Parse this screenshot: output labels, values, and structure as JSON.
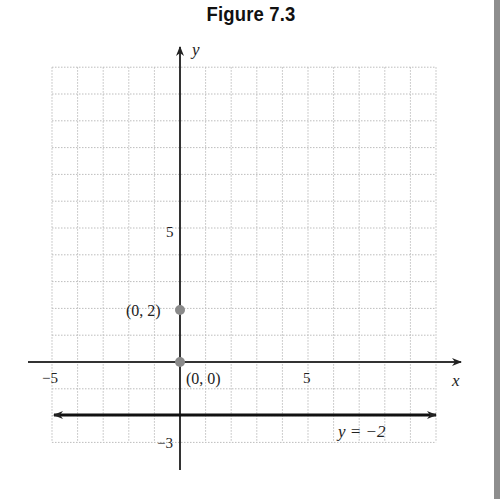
{
  "figure": {
    "title": "Figure 7.3"
  },
  "chart_data": {
    "type": "line",
    "title": "Figure 7.3",
    "xlabel": "x",
    "ylabel": "y",
    "xlim": [
      -5,
      10
    ],
    "ylim": [
      -3,
      11
    ],
    "grid": true,
    "x_ticks": [
      {
        "value": -5,
        "label": "−5"
      },
      {
        "value": 5,
        "label": "5"
      }
    ],
    "y_ticks": [
      {
        "value": 5,
        "label": "5"
      },
      {
        "value": -3,
        "label": "−3"
      }
    ],
    "series": [
      {
        "name": "y = −2",
        "type": "line",
        "x": [
          -5,
          10
        ],
        "y": [
          -2,
          -2
        ],
        "arrows": "both"
      }
    ],
    "points": [
      {
        "x": 0,
        "y": 2,
        "label": "(0, 2)"
      },
      {
        "x": 0,
        "y": 0,
        "label": "(0, 0)"
      }
    ],
    "annotations": [
      {
        "text": "y = −2",
        "x": 7,
        "y": -2.5
      }
    ]
  },
  "labels": {
    "x_axis": "x",
    "y_axis": "y",
    "tick_x_neg5": "−5",
    "tick_x_5": "5",
    "tick_y_5": "5",
    "tick_y_neg3": "−3",
    "point_a": "(0, 2)",
    "point_b": "(0, 0)",
    "line_label": "y = −2"
  },
  "colors": {
    "axis": "#222222",
    "grid": "#bdbdbd",
    "point": "#8a8a8a",
    "side_bar": "#8e8e8e"
  }
}
